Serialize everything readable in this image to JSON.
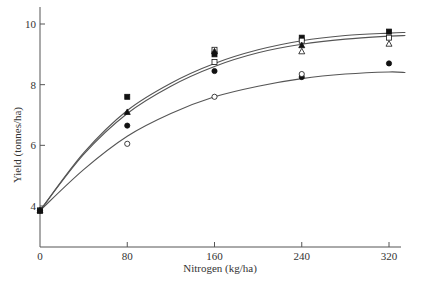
{
  "chart_data": {
    "type": "scatter",
    "title": "",
    "xlabel": "Nitrogen (kg/ha)",
    "ylabel": "Yield (tonnes/ha)",
    "xlim": [
      0,
      335
    ],
    "ylim": [
      2.65,
      10.55
    ],
    "x_ticks": [
      0,
      80,
      160,
      240,
      320
    ],
    "y_ticks": [
      4,
      6,
      8,
      10
    ],
    "grid": false,
    "legend": null,
    "series": [
      {
        "name": "filled-square",
        "marker": "square-filled",
        "x": [
          0,
          80,
          160,
          240,
          320
        ],
        "values": [
          3.85,
          7.6,
          9.0,
          9.55,
          9.75
        ]
      },
      {
        "name": "open-square",
        "marker": "square-open",
        "x": [
          0,
          160,
          160,
          240,
          320
        ],
        "values": [
          3.85,
          9.15,
          8.75,
          9.45,
          9.55
        ]
      },
      {
        "name": "filled-triangle",
        "marker": "triangle-filled",
        "x": [
          0,
          80,
          160,
          240
        ],
        "values": [
          3.85,
          7.1,
          9.1,
          9.3
        ]
      },
      {
        "name": "open-triangle",
        "marker": "triangle-open",
        "x": [
          240,
          320
        ],
        "values": [
          9.1,
          9.35
        ]
      },
      {
        "name": "filled-circle",
        "marker": "circle-filled",
        "x": [
          0,
          80,
          160,
          240,
          320
        ],
        "values": [
          3.85,
          6.65,
          8.45,
          8.25,
          8.7
        ]
      },
      {
        "name": "open-circle",
        "marker": "circle-open",
        "x": [
          80,
          160,
          240
        ],
        "values": [
          6.05,
          7.6,
          8.35
        ]
      }
    ],
    "curves": [
      {
        "name": "upper-fit",
        "x": [
          0,
          40,
          80,
          120,
          160,
          200,
          240,
          280,
          320,
          335
        ],
        "values": [
          3.85,
          5.75,
          7.15,
          8.05,
          8.7,
          9.15,
          9.45,
          9.62,
          9.7,
          9.72
        ]
      },
      {
        "name": "middle-fit",
        "x": [
          0,
          40,
          80,
          120,
          160,
          200,
          240,
          280,
          320,
          335
        ],
        "values": [
          3.85,
          5.7,
          7.05,
          7.95,
          8.6,
          9.05,
          9.33,
          9.5,
          9.6,
          9.62
        ]
      },
      {
        "name": "lower-fit",
        "x": [
          0,
          40,
          80,
          120,
          160,
          200,
          240,
          280,
          320,
          335
        ],
        "values": [
          3.85,
          5.2,
          6.3,
          7.05,
          7.6,
          7.95,
          8.2,
          8.35,
          8.42,
          8.4
        ]
      }
    ]
  }
}
